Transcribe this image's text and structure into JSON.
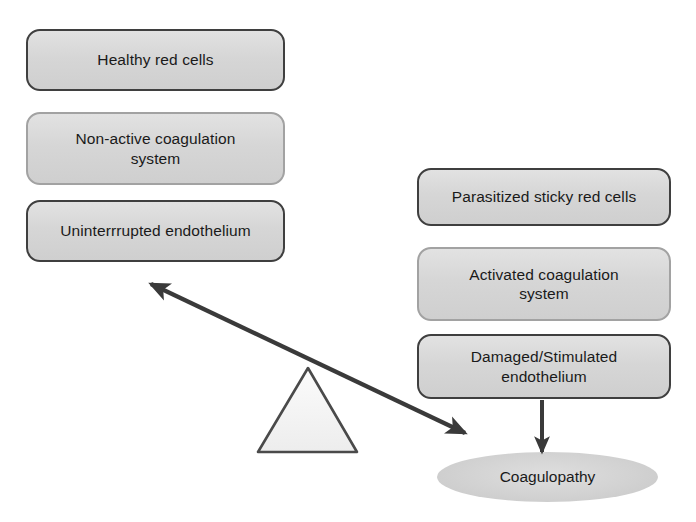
{
  "canvas": {
    "width": 696,
    "height": 522,
    "background": "#ffffff"
  },
  "diagram": {
    "type": "balance-scale-concept-diagram"
  },
  "colors": {
    "node_fill": "#d6d6d6",
    "node_border_dark": "#3f3f3f",
    "node_border_light": "#a2a2a2",
    "ellipse_fill": "#cfcfcf",
    "arrow": "#3a3a3a",
    "triangle_fill": "#f2f2f2",
    "triangle_border": "#4a4a4a",
    "text": "#1a1a1a",
    "background": "#ffffff"
  },
  "left_column": {
    "name": "healthy-state-stack",
    "boxes": [
      {
        "id": "healthy-red-cells",
        "label": "Healthy red cells",
        "border": "dark"
      },
      {
        "id": "non-active-coagulation-system",
        "label": "Non-active coagulation\nsystem",
        "border": "light"
      },
      {
        "id": "uninterrupted-endothelium",
        "label": "Uninterrrupted endothelium",
        "border": "dark"
      }
    ]
  },
  "right_column": {
    "name": "disease-state-stack",
    "boxes": [
      {
        "id": "parasitized-sticky-red-cells",
        "label": "Parasitized sticky red cells",
        "border": "dark"
      },
      {
        "id": "activated-coagulation-system",
        "label": "Activated coagulation\nsystem",
        "border": "light"
      },
      {
        "id": "damaged-stimulated-endothelium",
        "label": "Damaged/Stimulated\nendothelium",
        "border": "dark"
      }
    ]
  },
  "outcome": {
    "id": "coagulopathy",
    "label": "Coagulopathy",
    "shape": "ellipse"
  },
  "connectors": [
    {
      "id": "balance-beam",
      "kind": "double-headed-arrow",
      "from": {
        "x": 151,
        "y": 284
      },
      "to": {
        "x": 465,
        "y": 433
      },
      "label": ""
    },
    {
      "id": "endothelium-to-coagulopathy",
      "kind": "arrow",
      "from": {
        "x": 542,
        "y": 400
      },
      "to": {
        "x": 542,
        "y": 450
      },
      "label": ""
    }
  ],
  "fulcrum": {
    "id": "pivot-triangle",
    "shape": "triangle",
    "apex": {
      "x": 308,
      "y": 368
    },
    "left": {
      "x": 258,
      "y": 452
    },
    "right": {
      "x": 357,
      "y": 452
    }
  }
}
